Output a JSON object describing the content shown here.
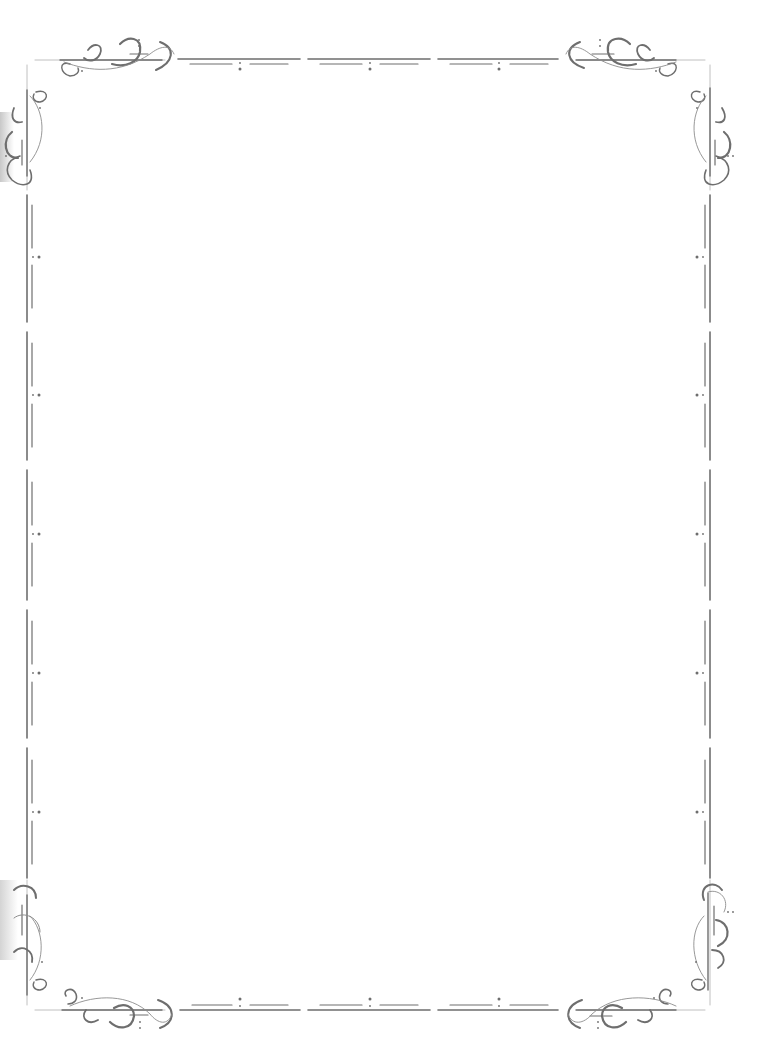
{
  "page": {
    "type": "decorative-page-border",
    "background": "#ffffff",
    "content_text": ""
  },
  "border": {
    "stroke_color": "#6e6e6e",
    "light_stroke_color": "#a8a8a8",
    "corners": [
      "top-left-flourish",
      "top-right-flourish",
      "bottom-left-flourish",
      "bottom-right-flourish"
    ],
    "top_segments": 3,
    "bottom_segments": 3,
    "left_segments": 5,
    "right_segments": 5,
    "segment_ornament": "colon-dots"
  },
  "colors": {
    "ink": "#6e6e6e",
    "hairline": "#b0b0b0",
    "shadow": "#d0d0d0"
  }
}
